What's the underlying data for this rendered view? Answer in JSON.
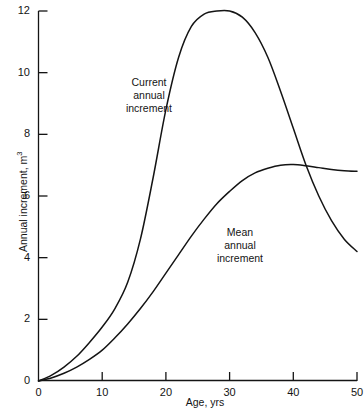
{
  "chart_data": {
    "type": "line",
    "title": "",
    "xlabel": "Age, yrs",
    "ylabel": "Annual increment, m",
    "ylabel_superscript": "3",
    "xlim": [
      0,
      50
    ],
    "ylim": [
      0,
      12
    ],
    "grid": false,
    "legend_position": "inline-annotations",
    "xticks": [
      "0",
      "10",
      "20",
      "30",
      "40",
      "50"
    ],
    "xtick_values": [
      0,
      10,
      20,
      30,
      40,
      50
    ],
    "yticks": [
      "0",
      "2",
      "4",
      "6",
      "8",
      "10",
      "12"
    ],
    "ytick_values": [
      0,
      2,
      4,
      6,
      8,
      10,
      12
    ],
    "series": [
      {
        "name": "Current annual increment",
        "annotation_lines": [
          "Current",
          "annual",
          "increment"
        ],
        "color": "#141414",
        "x": [
          0,
          2,
          4,
          6,
          8,
          10,
          12,
          14,
          16,
          18,
          20,
          22,
          24,
          26,
          28,
          30,
          32,
          34,
          36,
          38,
          40,
          42,
          44,
          46,
          48,
          50
        ],
        "y": [
          0,
          0.18,
          0.45,
          0.8,
          1.25,
          1.75,
          2.35,
          3.2,
          4.6,
          6.6,
          8.8,
          10.5,
          11.5,
          11.9,
          12.0,
          12.0,
          11.8,
          11.3,
          10.5,
          9.4,
          8.2,
          7.0,
          6.0,
          5.2,
          4.6,
          4.2
        ]
      },
      {
        "name": "Mean annual increment",
        "annotation_lines": [
          "Mean",
          "annual",
          "increment"
        ],
        "color": "#141414",
        "x": [
          0,
          2,
          4,
          6,
          8,
          10,
          12,
          14,
          16,
          18,
          20,
          22,
          24,
          26,
          28,
          30,
          32,
          34,
          36,
          38,
          40,
          42,
          44,
          46,
          48,
          50
        ],
        "y": [
          0,
          0.1,
          0.25,
          0.45,
          0.7,
          1.0,
          1.4,
          1.85,
          2.35,
          2.9,
          3.5,
          4.1,
          4.7,
          5.25,
          5.75,
          6.15,
          6.5,
          6.75,
          6.9,
          7.0,
          7.02,
          6.98,
          6.92,
          6.86,
          6.82,
          6.8
        ]
      }
    ],
    "annotations": [
      {
        "label": "Current annual increment",
        "lines": [
          "Current",
          "annual",
          "increment"
        ]
      },
      {
        "label": "Mean annual increment",
        "lines": [
          "Mean",
          "annual",
          "increment"
        ]
      }
    ]
  }
}
